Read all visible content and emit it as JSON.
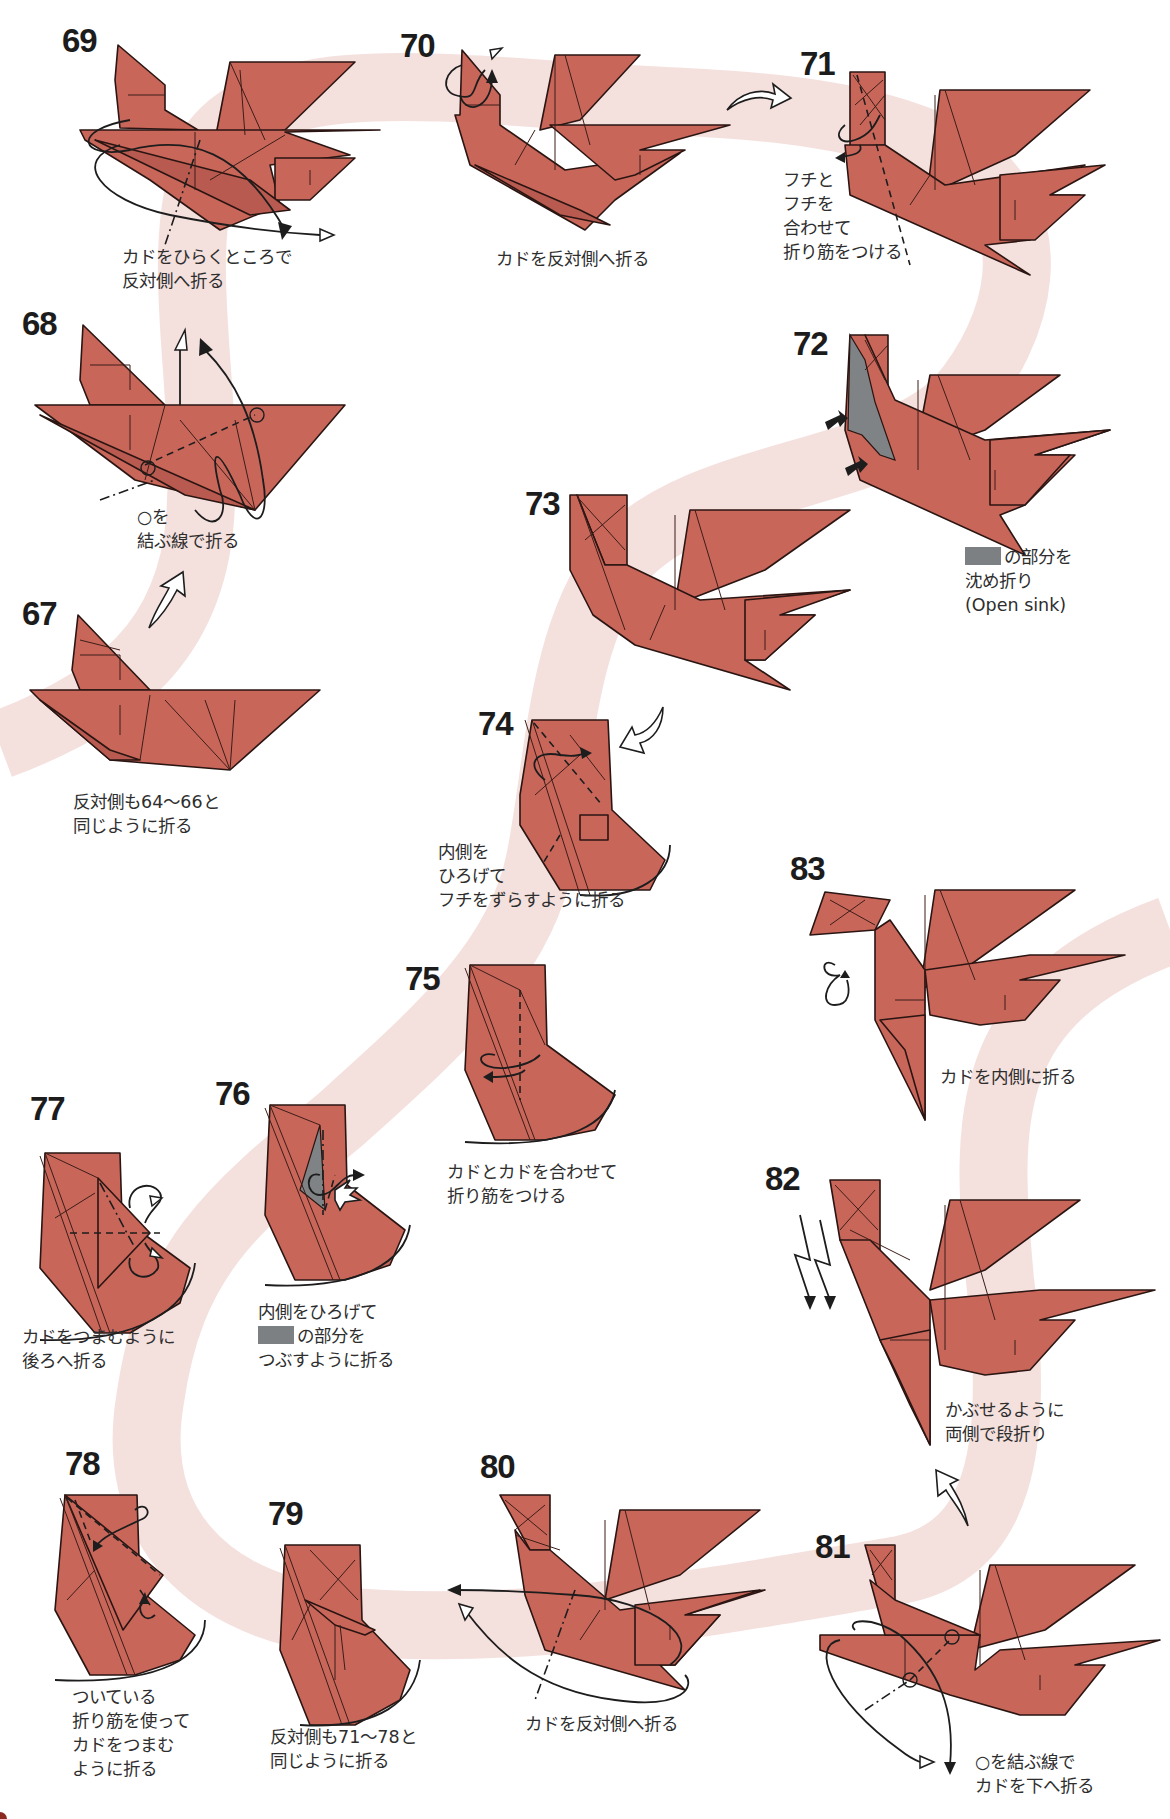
{
  "page": {
    "type": "origami-instruction-diagram-page",
    "colors": {
      "paper": "#c9665a",
      "paper_outline": "#2a1512",
      "sink_area": "#7f8385",
      "background_band": "#f2d9d6",
      "text": "#2e2e2e",
      "step_number": "#1c1c1c"
    }
  },
  "steps": [
    {
      "number": "67",
      "caption": [
        "反対側も64〜66と",
        "同じように折る"
      ]
    },
    {
      "number": "68",
      "caption": [
        "○を",
        "結ぶ線で折る"
      ]
    },
    {
      "number": "69",
      "caption": [
        "カドをひらくところで",
        "反対側へ折る"
      ]
    },
    {
      "number": "70",
      "caption": [
        "カドを反対側へ折る"
      ]
    },
    {
      "number": "71",
      "caption": [
        "フチと",
        "フチを",
        "合わせて",
        "折り筋をつける"
      ]
    },
    {
      "number": "72",
      "caption": [
        "の部分を",
        "沈め折り",
        "(Open sink)"
      ],
      "swatch": "gray"
    },
    {
      "number": "73",
      "caption": []
    },
    {
      "number": "74",
      "caption": [
        "内側を",
        "ひろげて",
        "フチをずらすように折る"
      ]
    },
    {
      "number": "75",
      "caption": [
        "カドとカドを合わせて",
        "折り筋をつける"
      ]
    },
    {
      "number": "76",
      "caption": [
        "内側をひろげて",
        "の部分を",
        "つぶすように折る"
      ],
      "swatch": "gray"
    },
    {
      "number": "77",
      "caption": [
        "カドをつまむように",
        "後ろへ折る"
      ]
    },
    {
      "number": "78",
      "caption": [
        "ついている",
        "折り筋を使って",
        "カドをつまむ",
        "ように折る"
      ]
    },
    {
      "number": "79",
      "caption": [
        "反対側も71〜78と",
        "同じように折る"
      ]
    },
    {
      "number": "80",
      "caption": [
        "カドを反対側へ折る"
      ]
    },
    {
      "number": "81",
      "caption": [
        "○を結ぶ線で",
        "カドを下へ折る"
      ]
    },
    {
      "number": "82",
      "caption": [
        "かぶせるように",
        "両側で段折り"
      ]
    },
    {
      "number": "83",
      "caption": [
        "カドを内側に折る"
      ]
    }
  ],
  "legend": {
    "icons": [
      "valley-fold-line",
      "mountain-fold-line",
      "fold-arrow",
      "flip-arrow",
      "push-arrow",
      "circle-reference-mark",
      "gray-sink-area"
    ]
  }
}
